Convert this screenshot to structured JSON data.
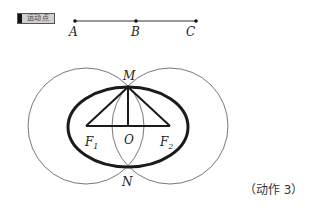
{
  "button": {
    "label": "运动点"
  },
  "segment": {
    "points": [
      {
        "name": "A",
        "x": 75,
        "y": 21
      },
      {
        "name": "B",
        "x": 136,
        "y": 21
      },
      {
        "name": "C",
        "x": 196,
        "y": 21
      }
    ]
  },
  "figure": {
    "labels": {
      "M": "M",
      "N": "N",
      "O": "O",
      "F": "F",
      "F1_sub": "1",
      "F2_sub": "2"
    },
    "points": {
      "M": {
        "x": 128,
        "y": 87
      },
      "N": {
        "x": 129,
        "y": 167
      },
      "O": {
        "x": 128,
        "y": 126
      },
      "F1": {
        "x": 86,
        "y": 126
      },
      "F2": {
        "x": 170,
        "y": 126
      }
    },
    "circles": [
      {
        "center": "F1",
        "r": 58
      },
      {
        "center": "F2",
        "r": 58
      }
    ],
    "ellipse": {
      "cx": 128,
      "cy": 127,
      "rx": 60,
      "ry": 40
    }
  },
  "caption": "（动作 3）",
  "colors": {
    "stroke": "#1a1a1a",
    "thin_stroke": "#555555",
    "button_bg": "#cfcfcf"
  }
}
